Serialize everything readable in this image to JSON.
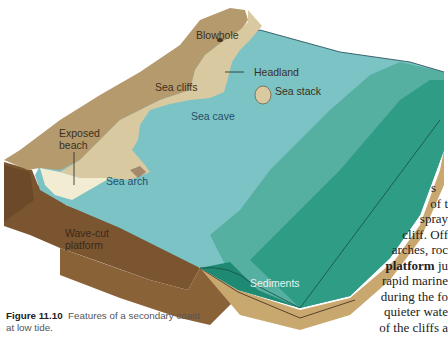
{
  "figure": {
    "number": "Figure 11.10",
    "caption": "Features of a secondary coast at low tide.",
    "labels": {
      "blowhole": "Blowhole",
      "headland": "Headland",
      "sea_cliffs": "Sea cliffs",
      "sea_stack": "Sea stack",
      "sea_cave": "Sea cave",
      "exposed_beach_1": "Exposed",
      "exposed_beach_2": "beach",
      "sea_arch": "Sea arch",
      "wave_cut_1": "Wave-cut",
      "wave_cut_2": "platform",
      "sediments": "Sediments"
    },
    "colors": {
      "land_top": "#b59a6e",
      "cliff_face": "#d9c9a0",
      "beach": "#f1ecd2",
      "shallow_water": "#7cc3c5",
      "mid_water": "#5bb3a8",
      "deep_water": "#2e9c86",
      "block_side_brown": "#7a5530",
      "block_side_sediment": "#c9a870",
      "sediment_water": "#1f8a73"
    }
  },
  "body_text": {
    "lines": [
      "s",
      "of t",
      "spray",
      "cliff. Off",
      "arches, roc",
      "platform ju",
      "rapid marine",
      "during the fo",
      "quieter wate",
      "of the cliffs a",
      "l   l l  l"
    ],
    "bold_term": "platform"
  }
}
